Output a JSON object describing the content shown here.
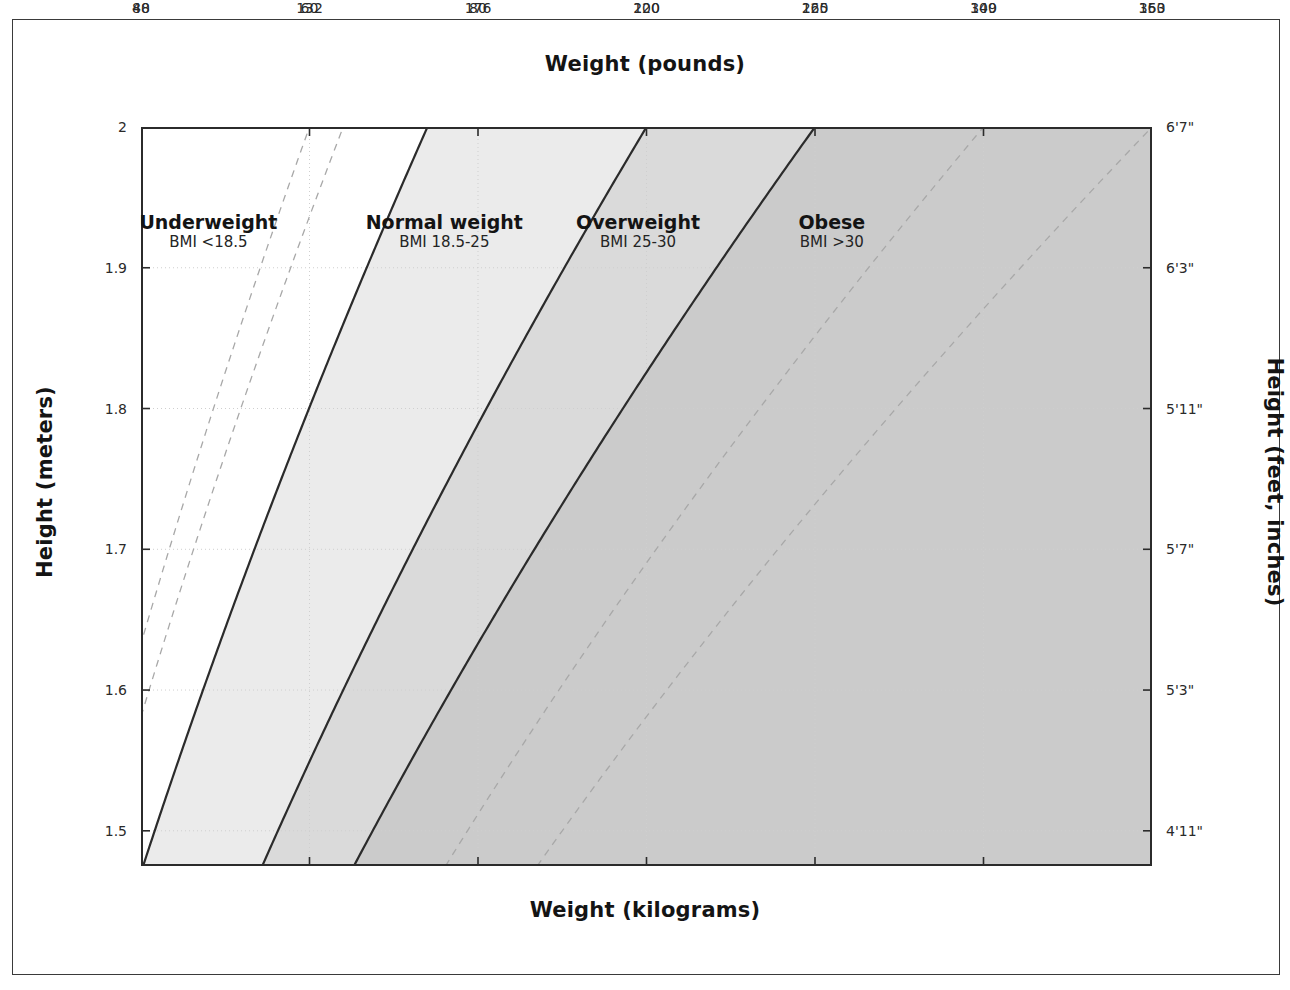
{
  "figure": {
    "kind": "bmi-nomogram"
  },
  "axes": {
    "top_title": "Weight (pounds)",
    "bottom_title": "Weight (kilograms)",
    "left_title": "Height (meters)",
    "right_title": "Height (feet, inches)",
    "top_ticks": [
      "88",
      "132",
      "176",
      "220",
      "265",
      "309",
      "353"
    ],
    "bottom_ticks": [
      "40",
      "60",
      "80",
      "100",
      "120",
      "140",
      "160"
    ],
    "left_ticks": [
      "1.5",
      "1.6",
      "1.7",
      "1.8",
      "1.9",
      "2"
    ],
    "right_ticks": [
      "4'11\"",
      "5'3\"",
      "5'7\"",
      "5'11\"",
      "6'3\"",
      "6'7\""
    ]
  },
  "regions": [
    {
      "name": "Underweight",
      "range": "BMI <18.5",
      "fill": "#ffffff"
    },
    {
      "name": "Normal weight",
      "range": "BMI 18.5-25",
      "fill": "#ebebeb"
    },
    {
      "name": "Overweight",
      "range": "BMI 25-30",
      "fill": "#dadada"
    },
    {
      "name": "Obese",
      "range": "BMI >30",
      "fill": "#cbcbcb"
    }
  ],
  "colors": {
    "frame": "#3a3a3a",
    "axis": "#2b2b2b",
    "solid_line": "#2b2b2b",
    "dashed_line": "#a8a8a8",
    "gridline": "#cfcfcf",
    "text": "#141414"
  },
  "chart_data": {
    "type": "line",
    "title": "",
    "xlabel": "Weight (kilograms)",
    "ylabel": "Height (meters)",
    "xlabel_secondary": "Weight (pounds)",
    "ylabel_secondary": "Height (feet, inches)",
    "xlim": [
      40,
      160
    ],
    "ylim": [
      1.475,
      2.0
    ],
    "xticks": [
      40,
      60,
      80,
      100,
      120,
      140,
      160
    ],
    "yticks": [
      1.5,
      1.6,
      1.7,
      1.8,
      1.9,
      2.0
    ],
    "xticks_top_kg": [
      40,
      60,
      80,
      100,
      120,
      140,
      160
    ],
    "xticklabels_top_lb": [
      88,
      132,
      176,
      220,
      265,
      309,
      353
    ],
    "yticks_right_m": [
      1.5,
      1.6,
      1.7,
      1.8,
      1.9,
      2.0
    ],
    "yticklabels_right": [
      "4'11\"",
      "5'3\"",
      "5'7\"",
      "5'11\"",
      "6'3\"",
      "6'7\""
    ],
    "grid": true,
    "legend": "none",
    "series": [
      {
        "name": "BMI 15",
        "bmi": 15,
        "style": "dashed",
        "formula": "weight_kg = bmi * height_m^2"
      },
      {
        "name": "BMI 16",
        "bmi": 16,
        "style": "dashed",
        "formula": "weight_kg = bmi * height_m^2"
      },
      {
        "name": "BMI 18.5",
        "bmi": 18.5,
        "style": "solid",
        "formula": "weight_kg = bmi * height_m^2"
      },
      {
        "name": "BMI 25",
        "bmi": 25,
        "style": "solid",
        "formula": "weight_kg = bmi * height_m^2"
      },
      {
        "name": "BMI 30",
        "bmi": 30,
        "style": "solid",
        "formula": "weight_kg = bmi * height_m^2"
      },
      {
        "name": "BMI 35",
        "bmi": 35,
        "style": "dashed",
        "formula": "weight_kg = bmi * height_m^2"
      },
      {
        "name": "BMI 40",
        "bmi": 40,
        "style": "dashed",
        "formula": "weight_kg = bmi * height_m^2"
      }
    ],
    "bands": [
      {
        "label": "Underweight",
        "bmi_min": 0,
        "bmi_max": 18.5,
        "fill": "#ffffff"
      },
      {
        "label": "Normal weight",
        "bmi_min": 18.5,
        "bmi_max": 25,
        "fill": "#ebebeb"
      },
      {
        "label": "Overweight",
        "bmi_min": 25,
        "bmi_max": 30,
        "fill": "#dadada"
      },
      {
        "label": "Obese",
        "bmi_min": 30,
        "bmi_max": 999,
        "fill": "#cbcbcb"
      }
    ],
    "annotations": [
      {
        "text": "Underweight",
        "sub": "BMI <18.5",
        "height_m": 1.93,
        "weight_kg": 48
      },
      {
        "text": "Normal weight",
        "sub": "BMI 18.5-25",
        "height_m": 1.93,
        "weight_kg": 76
      },
      {
        "text": "Overweight",
        "sub": "BMI 25-30",
        "height_m": 1.93,
        "weight_kg": 99
      },
      {
        "text": "Obese",
        "sub": "BMI >30",
        "height_m": 1.93,
        "weight_kg": 122
      }
    ]
  }
}
